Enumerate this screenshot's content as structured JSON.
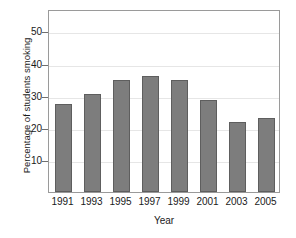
{
  "chart_data": {
    "type": "bar",
    "title": "",
    "xlabel": "Year",
    "ylabel": "Percentage of students smoking",
    "categories": [
      "1991",
      "1993",
      "1995",
      "1997",
      "1999",
      "2001",
      "2003",
      "2005"
    ],
    "values": [
      27.5,
      30.5,
      34.8,
      36.0,
      34.8,
      28.8,
      21.8,
      23.0
    ],
    "yticks": [
      10,
      20,
      30,
      40,
      50
    ],
    "ytick_labels": [
      "10",
      "20",
      "30",
      "40",
      "50"
    ],
    "ylim": [
      0,
      57
    ],
    "grid": true,
    "legend": "none",
    "bar_color": "#7d7d7d",
    "bar_edge_color": "#5e5e5e",
    "grid_color": "#e6e6e6",
    "axis_color": "#9a9a9a",
    "background": "#ffffff"
  }
}
